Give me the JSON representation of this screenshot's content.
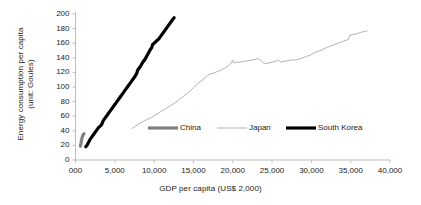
{
  "chart_data": {
    "type": "line",
    "title": "",
    "xlabel": "GDP per capita (US$ 2,000)",
    "ylabel_line1": "Energy consumption per capita",
    "ylabel_line2": "(unit: Goules)",
    "xlim": [
      0,
      40000
    ],
    "ylim": [
      0,
      200
    ],
    "x_ticks": [
      "000",
      "5,000",
      "10,000",
      "15,000",
      "20,000",
      "25,000",
      "30,000",
      "35,000",
      "40,000"
    ],
    "x_tick_values": [
      0,
      5000,
      10000,
      15000,
      20000,
      25000,
      30000,
      35000,
      40000
    ],
    "y_ticks": [
      "0",
      "20",
      "40",
      "60",
      "80",
      "100",
      "120",
      "140",
      "160",
      "180",
      "200"
    ],
    "y_tick_values": [
      0,
      20,
      40,
      60,
      80,
      100,
      120,
      140,
      160,
      180,
      200
    ],
    "grid": false,
    "legend_position": "inside-bottom-center",
    "series": [
      {
        "name": "China",
        "color": "#808080",
        "width": 3.2,
        "points": [
          [
            620,
            19
          ],
          [
            660,
            21
          ],
          [
            700,
            23
          ],
          [
            730,
            25
          ],
          [
            755,
            27
          ],
          [
            780,
            28
          ],
          [
            800,
            29
          ],
          [
            820,
            30
          ],
          [
            850,
            31
          ],
          [
            880,
            32
          ],
          [
            920,
            33
          ],
          [
            960,
            34
          ],
          [
            1000,
            35
          ],
          [
            1040,
            35.5
          ],
          [
            1080,
            36
          ]
        ]
      },
      {
        "name": "Japan",
        "color": "#b3b3b3",
        "width": 1.0,
        "points": [
          [
            7200,
            43
          ],
          [
            7600,
            46
          ],
          [
            8000,
            49
          ],
          [
            8500,
            52
          ],
          [
            9000,
            55
          ],
          [
            9600,
            58
          ],
          [
            10200,
            62
          ],
          [
            10800,
            66
          ],
          [
            11400,
            70
          ],
          [
            12000,
            74
          ],
          [
            12600,
            78
          ],
          [
            13200,
            83
          ],
          [
            13800,
            88
          ],
          [
            14400,
            93
          ],
          [
            15000,
            99
          ],
          [
            15600,
            105
          ],
          [
            16200,
            110
          ],
          [
            16800,
            116
          ],
          [
            17200,
            118
          ],
          [
            17600,
            119
          ],
          [
            18000,
            121
          ],
          [
            18500,
            123
          ],
          [
            19000,
            126
          ],
          [
            19400,
            129
          ],
          [
            19800,
            133
          ],
          [
            20000,
            137
          ],
          [
            20100,
            133
          ],
          [
            20400,
            134
          ],
          [
            20900,
            134
          ],
          [
            21400,
            135
          ],
          [
            21900,
            136
          ],
          [
            22400,
            137
          ],
          [
            22900,
            138
          ],
          [
            23300,
            139
          ],
          [
            23600,
            136
          ],
          [
            23900,
            133
          ],
          [
            24200,
            132
          ],
          [
            24600,
            133
          ],
          [
            25000,
            134
          ],
          [
            25400,
            135
          ],
          [
            25800,
            137
          ],
          [
            26100,
            134
          ],
          [
            26500,
            135
          ],
          [
            27000,
            136
          ],
          [
            27500,
            137
          ],
          [
            28000,
            137
          ],
          [
            28400,
            138
          ],
          [
            28900,
            140
          ],
          [
            29400,
            142
          ],
          [
            29900,
            144
          ],
          [
            30400,
            147
          ],
          [
            30900,
            149
          ],
          [
            31400,
            151
          ],
          [
            31900,
            154
          ],
          [
            32400,
            156
          ],
          [
            32900,
            158
          ],
          [
            33400,
            160
          ],
          [
            33900,
            162
          ],
          [
            34400,
            164
          ],
          [
            34700,
            165
          ],
          [
            34900,
            171
          ],
          [
            35300,
            172
          ],
          [
            35800,
            173
          ],
          [
            36300,
            175
          ],
          [
            36800,
            176
          ],
          [
            37100,
            177
          ]
        ]
      },
      {
        "name": "South Korea",
        "color": "#000000",
        "width": 3.2,
        "points": [
          [
            1300,
            18
          ],
          [
            1450,
            20
          ],
          [
            1600,
            23
          ],
          [
            1750,
            26
          ],
          [
            1900,
            29
          ],
          [
            2100,
            32
          ],
          [
            2300,
            35
          ],
          [
            2500,
            38
          ],
          [
            2700,
            41
          ],
          [
            2900,
            44
          ],
          [
            3100,
            46
          ],
          [
            3300,
            48
          ],
          [
            3450,
            52
          ],
          [
            3600,
            55
          ],
          [
            3800,
            58
          ],
          [
            4000,
            61
          ],
          [
            4200,
            64
          ],
          [
            4400,
            67
          ],
          [
            4600,
            70
          ],
          [
            4800,
            73
          ],
          [
            5000,
            76
          ],
          [
            5200,
            79
          ],
          [
            5400,
            82
          ],
          [
            5600,
            85
          ],
          [
            5800,
            88
          ],
          [
            6000,
            91
          ],
          [
            6200,
            94
          ],
          [
            6400,
            97
          ],
          [
            6600,
            100
          ],
          [
            6800,
            103
          ],
          [
            7000,
            106
          ],
          [
            7200,
            109
          ],
          [
            7400,
            112
          ],
          [
            7600,
            115
          ],
          [
            7800,
            119
          ],
          [
            7900,
            123
          ],
          [
            8100,
            126
          ],
          [
            8300,
            129
          ],
          [
            8500,
            133
          ],
          [
            8700,
            136
          ],
          [
            8900,
            139
          ],
          [
            9100,
            143
          ],
          [
            9300,
            147
          ],
          [
            9500,
            151
          ],
          [
            9700,
            154
          ],
          [
            9800,
            158
          ],
          [
            10000,
            160
          ],
          [
            10200,
            162
          ],
          [
            10400,
            164
          ],
          [
            10600,
            166
          ],
          [
            10800,
            169
          ],
          [
            11000,
            172
          ],
          [
            11200,
            175
          ],
          [
            11400,
            178
          ],
          [
            11600,
            181
          ],
          [
            11800,
            184
          ],
          [
            12000,
            187
          ],
          [
            12200,
            190
          ],
          [
            12400,
            193
          ],
          [
            12550,
            195
          ]
        ]
      }
    ]
  },
  "legend": {
    "items": [
      {
        "label": "China",
        "color": "#808080",
        "width": 3.2
      },
      {
        "label": "Japan",
        "color": "#b3b3b3",
        "width": 1.0
      },
      {
        "label": "South Korea",
        "color": "#000000",
        "width": 3.2
      }
    ]
  },
  "axis_style": {
    "axis_color": "#bfbfbf",
    "tick_color": "#bfbfbf",
    "text_color": "#1a1a1a"
  }
}
